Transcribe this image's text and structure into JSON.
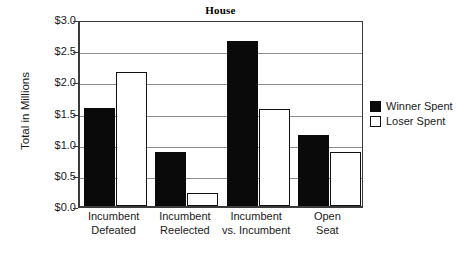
{
  "chart_data": {
    "type": "bar",
    "title": "House",
    "xlabel": "",
    "ylabel": "Total in Millions",
    "categories": [
      "Incumbent\nDefeated",
      "Incumbent\nReelected",
      "Incumbent\nvs. Incumbent",
      "Open\nSeat"
    ],
    "category_lines": [
      [
        "Incumbent",
        "Defeated"
      ],
      [
        "Incumbent",
        "Reelected"
      ],
      [
        "Incumbent",
        "vs. Incumbent"
      ],
      [
        "Open",
        "Seat"
      ]
    ],
    "series": [
      {
        "name": "Winner Spent",
        "color": "#0a0a0a",
        "values": [
          1.58,
          0.87,
          2.65,
          1.14
        ]
      },
      {
        "name": "Loser Spent",
        "color": "#ffffff",
        "values": [
          2.15,
          0.21,
          1.56,
          0.86
        ]
      }
    ],
    "ylim": [
      0,
      3.0
    ],
    "ytick_values": [
      0.0,
      0.5,
      1.0,
      1.5,
      2.0,
      2.5,
      3.0
    ],
    "ytick_labels": [
      "$0.0",
      "$0.5",
      "$1.0",
      "$1.5",
      "$2.0",
      "$2.5",
      "$3.0"
    ],
    "grid": true,
    "legend_position": "right"
  },
  "legend": {
    "items": [
      {
        "label": "Winner Spent"
      },
      {
        "label": "Loser Spent"
      }
    ]
  }
}
